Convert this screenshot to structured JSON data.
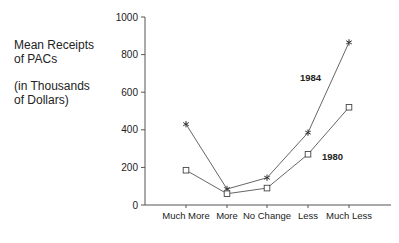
{
  "chart_data": {
    "type": "line",
    "title": "",
    "ylabel_lines": [
      "Mean Receipts",
      "of PACs",
      "",
      "(in Thousands",
      "of Dollars)"
    ],
    "xlabel": "",
    "categories": [
      "Much More",
      "More",
      "No Change",
      "Less",
      "Much Less"
    ],
    "ylim": [
      0,
      1000
    ],
    "yticks": [
      0,
      200,
      400,
      600,
      800,
      1000
    ],
    "grid": false,
    "legend": "inline labels",
    "series": [
      {
        "name": "1984",
        "marker": "asterisk",
        "values": [
          430,
          85,
          145,
          385,
          865
        ]
      },
      {
        "name": "1980",
        "marker": "square",
        "values": [
          185,
          60,
          90,
          270,
          520
        ]
      }
    ]
  },
  "ylabel": {
    "line1": "Mean Receipts",
    "line2": "of PACs",
    "line3": "(in Thousands",
    "line4": "of Dollars)"
  }
}
